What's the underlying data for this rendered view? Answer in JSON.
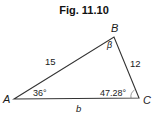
{
  "figure": {
    "title": "Fig. 11.10",
    "vertices": [
      {
        "id": "A",
        "label": "A"
      },
      {
        "id": "B",
        "label": "B"
      },
      {
        "id": "C",
        "label": "C"
      }
    ],
    "sides": {
      "AB": "15",
      "BC": "12",
      "AC": "b"
    },
    "angles": {
      "A": "36°",
      "B": "β",
      "C": "47.28°"
    },
    "colors": {
      "stroke": "#333333",
      "text": "#1a1a1a"
    }
  }
}
